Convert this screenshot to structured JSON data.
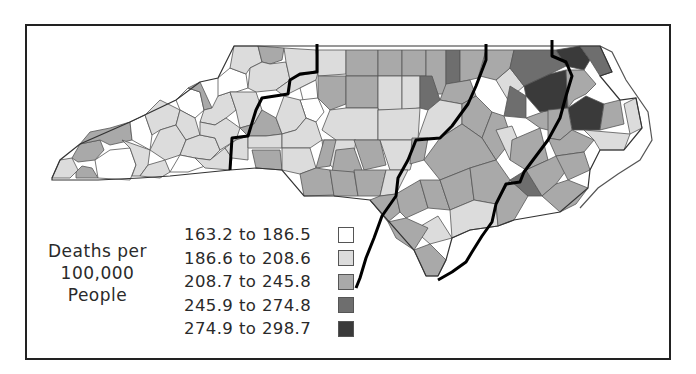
{
  "map": {
    "subject": "North Carolina counties",
    "legend": {
      "title_lines": [
        "Deaths per",
        "100,000",
        "People"
      ],
      "classes": [
        {
          "label": "163.2 to 186.5",
          "color": "#ffffff"
        },
        {
          "label": "186.6 to 208.6",
          "color": "#dcdcdc"
        },
        {
          "label": "208.7 to 245.8",
          "color": "#a9a9a9"
        },
        {
          "label": "245.9 to 274.8",
          "color": "#6e6e6e"
        },
        {
          "label": "274.9 to 298.7",
          "color": "#3a3a3a"
        }
      ]
    },
    "colors": {
      "frame": "#222222",
      "county_border": "#555555",
      "region_divider": "#000000",
      "background": "#ffffff"
    }
  }
}
